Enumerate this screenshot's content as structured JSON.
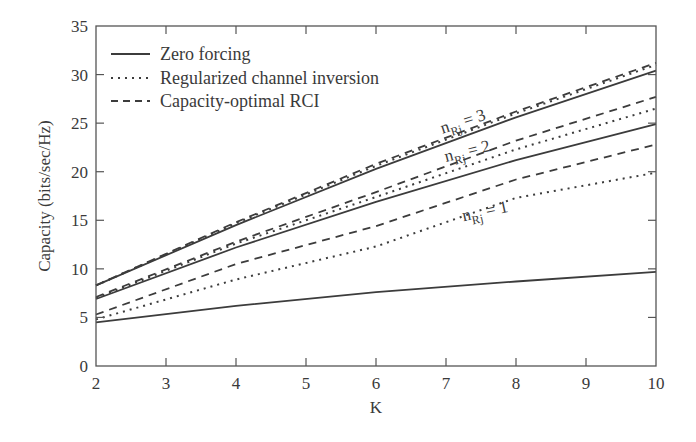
{
  "chart_data": {
    "type": "line",
    "title": "",
    "xlabel": "K",
    "ylabel": "Capacity (bits/sec/Hz)",
    "xlim": [
      2,
      10
    ],
    "ylim": [
      0,
      35
    ],
    "xticks": [
      2,
      3,
      4,
      5,
      6,
      7,
      8,
      9,
      10
    ],
    "yticks": [
      0,
      5,
      10,
      15,
      20,
      25,
      30,
      35
    ],
    "grid": false,
    "legend_position": "upper-left",
    "legend": [
      {
        "label": "Zero forcing",
        "style": "solid"
      },
      {
        "label": "Regularized channel inversion",
        "style": "dotted"
      },
      {
        "label": "Capacity-optimal RCI",
        "style": "dashed"
      }
    ],
    "x": [
      2,
      4,
      6,
      8,
      10
    ],
    "series": [
      {
        "name": "Zero forcing, n_Rj = 3",
        "group": "n_Rj = 3",
        "style": "solid",
        "values": [
          8.3,
          14.5,
          20.3,
          25.6,
          30.4
        ]
      },
      {
        "name": "Regularized channel inversion, n_Rj = 3",
        "group": "n_Rj = 3",
        "style": "dotted",
        "values": [
          8.3,
          14.7,
          20.6,
          26.0,
          31.0
        ]
      },
      {
        "name": "Capacity-optimal RCI, n_Rj = 3",
        "group": "n_Rj = 3",
        "style": "dashed",
        "values": [
          8.3,
          14.8,
          20.8,
          26.2,
          31.2
        ]
      },
      {
        "name": "Zero forcing, n_Rj = 2",
        "group": "n_Rj = 2",
        "style": "solid",
        "values": [
          6.9,
          12.2,
          16.9,
          21.2,
          24.9
        ]
      },
      {
        "name": "Regularized channel inversion, n_Rj = 2",
        "group": "n_Rj = 2",
        "style": "dotted",
        "values": [
          7.0,
          12.6,
          17.4,
          22.3,
          26.5
        ]
      },
      {
        "name": "Capacity-optimal RCI, n_Rj = 2",
        "group": "n_Rj = 2",
        "style": "dashed",
        "values": [
          7.1,
          12.8,
          17.9,
          23.2,
          27.7
        ]
      },
      {
        "name": "Zero forcing, n_Rj = 1",
        "group": "n_Rj = 1",
        "style": "solid",
        "values": [
          4.5,
          6.2,
          7.6,
          8.7,
          9.7
        ]
      },
      {
        "name": "Regularized channel inversion, n_Rj = 1",
        "group": "n_Rj = 1",
        "style": "dotted",
        "values": [
          4.8,
          8.9,
          12.3,
          17.3,
          19.9
        ]
      },
      {
        "name": "Capacity-optimal RCI, n_Rj = 1",
        "group": "n_Rj = 1",
        "style": "dashed",
        "values": [
          5.3,
          10.5,
          14.4,
          19.2,
          22.8
        ]
      }
    ],
    "annotations": [
      {
        "base": "n",
        "sub": "Rj",
        "text": " = 3",
        "x": 6.95,
        "y": 23.9,
        "rotate": -18
      },
      {
        "base": "n",
        "sub": "Rj",
        "text": " = 2",
        "x": 7.0,
        "y": 21.0,
        "rotate": -14
      },
      {
        "base": "n",
        "sub": "Rj",
        "text": " = 1",
        "x": 7.25,
        "y": 14.9,
        "rotate": -12
      }
    ]
  },
  "colors": {
    "line": "#3c3c3c",
    "axis": "#555555",
    "text": "#3a3a3a",
    "background": "#ffffff"
  }
}
